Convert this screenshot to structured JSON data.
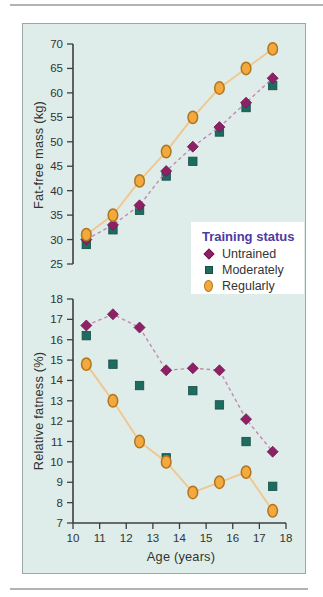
{
  "panel": {
    "background": "#deede9",
    "border_color": "#9aa7a4"
  },
  "divider_color": "#b3b3b3",
  "colors": {
    "axis": "#3e3e3e",
    "tick_text": "#333333",
    "label_text": "#333333"
  },
  "legend": {
    "title": "Training status",
    "title_color": "#4c3aa3",
    "background": "#ffffff",
    "items": [
      {
        "label": "Untrained"
      },
      {
        "label": "Moderately"
      },
      {
        "label": "Regularly"
      }
    ]
  },
  "chart_data": [
    {
      "type": "line",
      "title": "",
      "xlabel": "",
      "ylabel": "Fat-free mass (kg)",
      "xlim": [
        10,
        18
      ],
      "ylim": [
        25,
        70
      ],
      "ytick_step": 5,
      "grid": false,
      "legend_position": "inside lower-right of upper chart",
      "x": [
        10.5,
        11.5,
        12.5,
        13.5,
        14.5,
        15.5,
        16.5,
        17.5
      ],
      "series": [
        {
          "name": "Untrained",
          "marker": "diamond",
          "marker_fill": "#8e2166",
          "marker_stroke": "#70184f",
          "line": "dashed",
          "line_color": "#c687af",
          "values": [
            30,
            33,
            37,
            44,
            49,
            53,
            58,
            63
          ]
        },
        {
          "name": "Moderately",
          "marker": "square",
          "marker_fill": "#1e6b60",
          "marker_stroke": "#124f46",
          "line": "none",
          "line_color": "",
          "values": [
            29,
            32,
            36,
            43,
            46,
            52,
            57,
            61.5
          ]
        },
        {
          "name": "Regularly",
          "marker": "circle",
          "marker_fill": "#f3a93e",
          "marker_stroke": "#b0761f",
          "line": "solid",
          "line_color": "#f1c78e",
          "values": [
            31,
            35,
            42,
            48,
            55,
            61,
            65,
            69
          ]
        }
      ]
    },
    {
      "type": "line",
      "title": "",
      "xlabel": "Age (years)",
      "ylabel": "Relative fatness (%)",
      "xlim": [
        10,
        18
      ],
      "ylim": [
        7,
        18
      ],
      "ytick_step": 1,
      "xticks": [
        10,
        11,
        12,
        13,
        14,
        15,
        16,
        17,
        18
      ],
      "grid": false,
      "x": [
        10.5,
        11.5,
        12.5,
        13.5,
        14.5,
        15.5,
        16.5,
        17.5
      ],
      "series": [
        {
          "name": "Untrained",
          "marker": "diamond",
          "marker_fill": "#8e2166",
          "marker_stroke": "#70184f",
          "line": "dashed",
          "line_color": "#c687af",
          "values": [
            16.7,
            17.25,
            16.6,
            14.5,
            14.6,
            14.5,
            12.1,
            10.5
          ]
        },
        {
          "name": "Moderately",
          "marker": "square",
          "marker_fill": "#1e6b60",
          "marker_stroke": "#124f46",
          "line": "none",
          "line_color": "",
          "values": [
            16.2,
            14.8,
            13.75,
            10.2,
            13.5,
            12.8,
            11.0,
            8.8
          ]
        },
        {
          "name": "Regularly",
          "marker": "circle",
          "marker_fill": "#f3a93e",
          "marker_stroke": "#b0761f",
          "line": "solid",
          "line_color": "#f1c78e",
          "values": [
            14.8,
            13.0,
            11.0,
            10.0,
            8.5,
            9.0,
            9.5,
            7.6
          ]
        }
      ]
    }
  ]
}
